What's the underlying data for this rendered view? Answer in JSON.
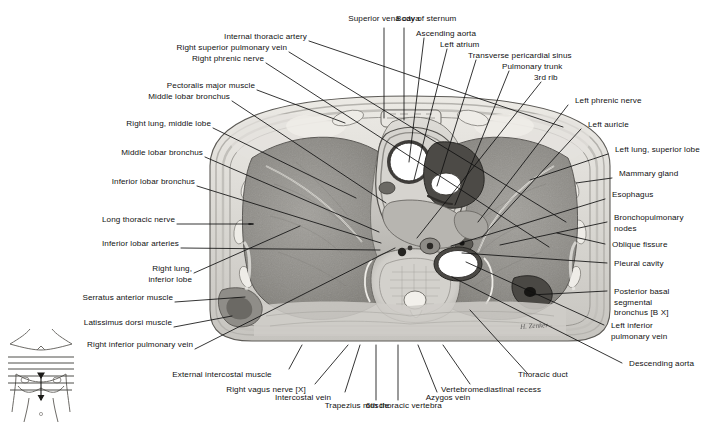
{
  "figure": {
    "type": "anatomical-cross-section",
    "signature": "H. Zenker",
    "orientation_key": {
      "name": "body-orientation-diagram",
      "description": "anterior torso outline with horizontal section level lines"
    },
    "palette": {
      "lung_tissue": "#8d8d8d",
      "mediastinum": "#c9c7c2",
      "body_wall": "#d8d6d1",
      "vessel_lumen": "#ffffff",
      "bone": "#e8e6e1",
      "leader_line": "#111111",
      "background": "#ffffff"
    }
  },
  "labels_top": [
    {
      "text": "Superior vena cava",
      "align": "center"
    },
    {
      "text": "Body of sternum",
      "align": "left"
    },
    {
      "text": "Ascending aorta",
      "align": "left"
    },
    {
      "text": "Left atrium",
      "align": "left"
    },
    {
      "text": "Transverse pericardial sinus",
      "align": "left"
    },
    {
      "text": "Pulmonary trunk",
      "align": "left"
    },
    {
      "text": "3rd rib",
      "align": "left"
    }
  ],
  "labels_left": [
    {
      "text": "Internal thoracic artery"
    },
    {
      "text": "Right superior pulmonary vein"
    },
    {
      "text": "Right phrenic nerve"
    },
    {
      "text": "Pectoralis major muscle"
    },
    {
      "text": "Middle lobar bronchus"
    },
    {
      "text": "Right lung, middle lobe"
    },
    {
      "text": "Middle lobar bronchus"
    },
    {
      "text": "Inferior lobar bronchus"
    },
    {
      "text": "Long thoracic nerve"
    },
    {
      "text": "Inferior lobar arteries"
    },
    {
      "text": "Right lung,\ninferior lobe"
    },
    {
      "text": "Serratus anterior muscle"
    },
    {
      "text": "Latissimus dorsi muscle"
    },
    {
      "text": "Right inferior pulmonary vein"
    }
  ],
  "labels_right": [
    {
      "text": "Left phrenic nerve"
    },
    {
      "text": "Left auricle"
    },
    {
      "text": "Left lung, superior lobe"
    },
    {
      "text": "Mammary gland"
    },
    {
      "text": "Esophagus"
    },
    {
      "text": "Bronchopulmonary\nnodes"
    },
    {
      "text": "Oblique fissure"
    },
    {
      "text": "Pleural cavity"
    },
    {
      "text": "Posterior basal\nsegmental\nbronchus [B X]"
    },
    {
      "text": "Left inferior\npulmonary vein"
    },
    {
      "text": "Descending aorta"
    }
  ],
  "labels_bottom": [
    {
      "text": "External intercostal muscle"
    },
    {
      "text": "Right vagus nerve [X]"
    },
    {
      "text": "Intercostal vein"
    },
    {
      "text": "Trapezius muscle"
    },
    {
      "text": "6th thoracic vertebra"
    },
    {
      "text": "Azygos vein"
    },
    {
      "text": "Vertebromediastinal recess"
    },
    {
      "text": "Thoracic duct"
    }
  ]
}
